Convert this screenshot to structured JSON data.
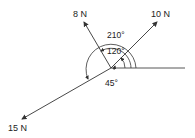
{
  "diagram": {
    "type": "force vectors",
    "forces": [
      {
        "id": "f10",
        "label": "10 N",
        "magnitude": 10,
        "unit": "N",
        "angle_deg": 45
      },
      {
        "id": "f8",
        "label": "8 N",
        "magnitude": 8,
        "unit": "N",
        "angle_deg": 120
      },
      {
        "id": "f15",
        "label": "15 N",
        "magnitude": 15,
        "unit": "N",
        "angle_deg": 210
      }
    ],
    "angles": [
      {
        "label": "210°",
        "value": 210
      },
      {
        "label": "120°",
        "value": 120
      },
      {
        "label": "45°",
        "value": 45
      }
    ],
    "reference": "positive x-axis"
  }
}
